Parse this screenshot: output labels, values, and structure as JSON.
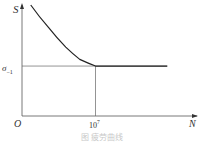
{
  "chart_data": {
    "type": "line",
    "title": "",
    "caption": "图 疲劳曲线",
    "xlabel": "N",
    "ylabel": "S",
    "origin_label": "O",
    "x_ticks": [
      {
        "label_base": "10",
        "label_exp": "7",
        "value": 0.42
      }
    ],
    "y_ticks": [
      {
        "label_base": "σ",
        "label_sub": "−1",
        "value": 0.45
      }
    ],
    "series": [
      {
        "name": "S-N curve",
        "points": [
          [
            0.05,
            1.0
          ],
          [
            0.15,
            0.8
          ],
          [
            0.25,
            0.62
          ],
          [
            0.33,
            0.51
          ],
          [
            0.42,
            0.45
          ],
          [
            0.6,
            0.45
          ],
          [
            0.83,
            0.45
          ]
        ]
      }
    ],
    "reference_lines": [
      {
        "type": "horizontal",
        "y": 0.45,
        "label": "σ−1"
      },
      {
        "type": "vertical",
        "x": 0.42,
        "label": "10^7"
      }
    ],
    "xlim": [
      0,
      1
    ],
    "ylim": [
      0,
      1
    ],
    "grid": false,
    "legend": "none"
  }
}
